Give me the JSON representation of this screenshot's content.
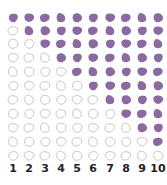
{
  "colors": {
    "filled": "#8a6aa0",
    "outline": "#bfbfbf"
  },
  "rows_per_column": 11,
  "columns": [
    {
      "label": "1",
      "filled": 1
    },
    {
      "label": "2",
      "filled": 2
    },
    {
      "label": "3",
      "filled": 3
    },
    {
      "label": "4",
      "filled": 4
    },
    {
      "label": "5",
      "filled": 5
    },
    {
      "label": "6",
      "filled": 6
    },
    {
      "label": "7",
      "filled": 7
    },
    {
      "label": "8",
      "filled": 8
    },
    {
      "label": "9",
      "filled": 9
    },
    {
      "label": "10",
      "filled": 10
    }
  ]
}
